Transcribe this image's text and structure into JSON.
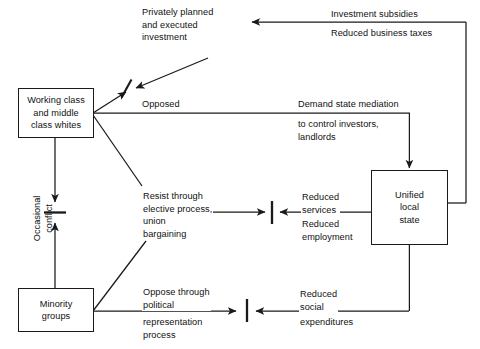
{
  "diagram": {
    "background_color": "#ffffff",
    "stroke_color": "#1a1a1a",
    "nodes": [
      {
        "id": "working-class",
        "label": "Working class\nand middle\nclass whites"
      },
      {
        "id": "minority-groups",
        "label": "Minority\ngroups"
      },
      {
        "id": "unified-local-state",
        "label": "Unified\nlocal\nstate"
      }
    ],
    "edge_labels": {
      "privately_planned_investment": "Privately planned\nand executed\ninvestment",
      "opposed": "Opposed",
      "investment_subsidies": "Investment subsidies",
      "reduced_business_taxes": "Reduced business taxes",
      "demand_state_mediation": "Demand state mediation",
      "to_control_investors": "to control investors,\nlandlords",
      "resist_through": "Resist through\nelective process,\nunion\nbargaining",
      "reduced_services": "Reduced\nservices",
      "reduced_employment": "Reduced\nemployment",
      "oppose_through": "Oppose through\npolitical",
      "representation_process": "representation\nprocess",
      "reduced_social": "Reduced\nsocial",
      "expenditures": "expenditures",
      "occasional_conflict": "Occasional\nconflict"
    }
  }
}
